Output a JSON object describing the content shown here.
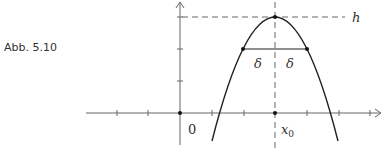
{
  "caption": "Abb. 5.10",
  "labels": {
    "h": "h",
    "delta_left": "δ",
    "delta_right": "δ",
    "origin": "0",
    "x0": "x",
    "x0_sub": "0"
  },
  "colors": {
    "axis": "#555555",
    "curve": "#222222",
    "dashed": "#666666"
  }
}
